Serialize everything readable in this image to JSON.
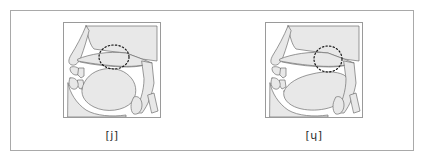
{
  "figure": {
    "type": "mid-sagittal vocal tract diagrams",
    "panel_count": 2,
    "frame_color": "#a9a9a9",
    "panel_border_color": "#9a9a9a",
    "tissue_fill": "#e8e8e8",
    "outline_color": "#6f6f6f",
    "highlight_color": "#1a1a1a"
  },
  "panels": [
    {
      "id": "panel-j",
      "caption": "[j]",
      "symbol": "j",
      "articulation": "palatal approximant",
      "highlight": {
        "shape": "dotted-ellipse",
        "cx": 50,
        "cy": 34,
        "rx": 15,
        "ry": 12,
        "location": "palatal constriction between tongue front and hard palate"
      }
    },
    {
      "id": "panel-labial-palatal",
      "caption": "[ɥ]",
      "symbol": "ɥ",
      "articulation": "labial-palatal approximant",
      "highlight": {
        "shape": "dotted-ellipse",
        "cx": 62,
        "cy": 36,
        "rx": 14,
        "ry": 13,
        "location": "palatal constriction with simultaneous lip rounding"
      }
    }
  ]
}
